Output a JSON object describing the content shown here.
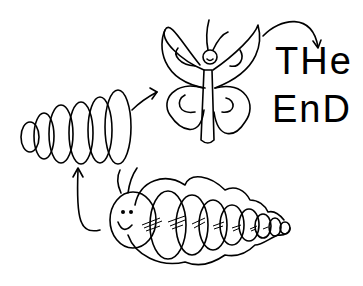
{
  "stages": [
    {
      "name": "caterpillar"
    },
    {
      "name": "chrysalis"
    },
    {
      "name": "butterfly"
    }
  ],
  "caption": {
    "line1": "THe",
    "line2": "EnD"
  },
  "colors": {
    "ink": "#000000",
    "background": "#ffffff"
  }
}
